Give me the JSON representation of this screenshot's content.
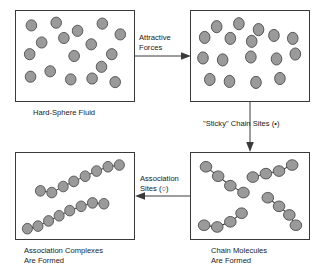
{
  "figure": {
    "sphere_color": "#9a9a9a",
    "sphere_outline_color": "#4a4a4a",
    "panel_border_color": "#3a3a3a",
    "background_color": "#ffffff"
  },
  "panels": {
    "hard_sphere_fluid": {
      "caption": "Hard-Sphere Fluid",
      "sphere_count": 17,
      "description": "Dispersed individual spheres"
    },
    "sticky_spheres": {
      "caption": "",
      "sphere_count": 17,
      "description": "Spheres drawn closer by attractive forces"
    },
    "chain_molecules": {
      "caption": "Chain Molecules\nAre Formed",
      "chain_count": 4,
      "spheres_per_chain": 4,
      "description": "Four tetramer chains in varied orientations"
    },
    "association_complexes": {
      "caption": "Association Complexes\nAre Formed",
      "chain_count": 2,
      "spheres_per_chain": 8,
      "description": "Two long eight-sphere association complexes"
    }
  },
  "arrows": {
    "attractive_forces": {
      "label": "Attractive\nForces",
      "direction": "right"
    },
    "sticky_chain_sites": {
      "label": "\"Sticky\" Chain Sites (•)",
      "direction": "down",
      "site_symbol": "•"
    },
    "association_sites": {
      "label": "Association\nSites (○)",
      "direction": "left",
      "site_symbol": "○"
    }
  },
  "chart_data": {
    "type": "diagram",
    "stages": [
      {
        "order": 1,
        "name": "Hard-Sphere Fluid",
        "units": 17,
        "grouping": "monomer"
      },
      {
        "order": 2,
        "name": "Sticky Sphere Fluid",
        "units": 17,
        "grouping": "monomer"
      },
      {
        "order": 3,
        "name": "Chain Molecules Are Formed",
        "units": 16,
        "grouping": "4 chains of 4"
      },
      {
        "order": 4,
        "name": "Association Complexes Are Formed",
        "units": 16,
        "grouping": "2 chains of 8"
      }
    ],
    "transitions": [
      {
        "from": "Hard-Sphere Fluid",
        "to": "Sticky Sphere Fluid",
        "label": "Attractive Forces"
      },
      {
        "from": "Sticky Sphere Fluid",
        "to": "Chain Molecules",
        "label": "\"Sticky\" Chain Sites (•)"
      },
      {
        "from": "Chain Molecules",
        "to": "Association Complexes",
        "label": "Association Sites (○)"
      }
    ]
  },
  "geometry": {
    "hard_sphere_positions": [
      [
        18,
        16
      ],
      [
        47,
        13
      ],
      [
        72,
        22
      ],
      [
        101,
        14
      ],
      [
        122,
        26
      ],
      [
        30,
        35
      ],
      [
        56,
        30
      ],
      [
        88,
        37
      ],
      [
        112,
        48
      ],
      [
        16,
        48
      ],
      [
        68,
        50
      ],
      [
        100,
        62
      ],
      [
        40,
        67
      ],
      [
        17,
        73
      ],
      [
        64,
        76
      ],
      [
        89,
        75
      ],
      [
        116,
        79
      ]
    ],
    "sticky_positions": [
      [
        30,
        16
      ],
      [
        56,
        13
      ],
      [
        79,
        19
      ],
      [
        16,
        27
      ],
      [
        46,
        28
      ],
      [
        71,
        31
      ],
      [
        97,
        25
      ],
      [
        119,
        28
      ],
      [
        14,
        48
      ],
      [
        37,
        50
      ],
      [
        70,
        47
      ],
      [
        100,
        49
      ],
      [
        122,
        44
      ],
      [
        22,
        70
      ],
      [
        45,
        72
      ],
      [
        76,
        73
      ],
      [
        104,
        69
      ]
    ],
    "chain_molecules": [
      [
        [
          16,
          16
        ],
        [
          29,
          27
        ],
        [
          42,
          38
        ],
        [
          56,
          46
        ]
      ],
      [
        [
          66,
          28
        ],
        [
          80,
          24
        ],
        [
          94,
          21
        ],
        [
          108,
          14
        ]
      ],
      [
        [
          82,
          52
        ],
        [
          94,
          62
        ],
        [
          105,
          72
        ],
        [
          112,
          84
        ]
      ],
      [
        [
          14,
          84
        ],
        [
          28,
          86
        ],
        [
          42,
          80
        ],
        [
          54,
          70
        ]
      ]
    ],
    "association_complexes": [
      [
        [
          30,
          44
        ],
        [
          44,
          46
        ],
        [
          58,
          39
        ],
        [
          71,
          33
        ],
        [
          85,
          27
        ],
        [
          99,
          21
        ],
        [
          113,
          16
        ],
        [
          127,
          14
        ]
      ],
      [
        [
          14,
          88
        ],
        [
          27,
          85
        ],
        [
          40,
          79
        ],
        [
          53,
          73
        ],
        [
          66,
          67
        ],
        [
          80,
          62
        ],
        [
          94,
          58
        ],
        [
          108,
          59
        ]
      ]
    ]
  }
}
